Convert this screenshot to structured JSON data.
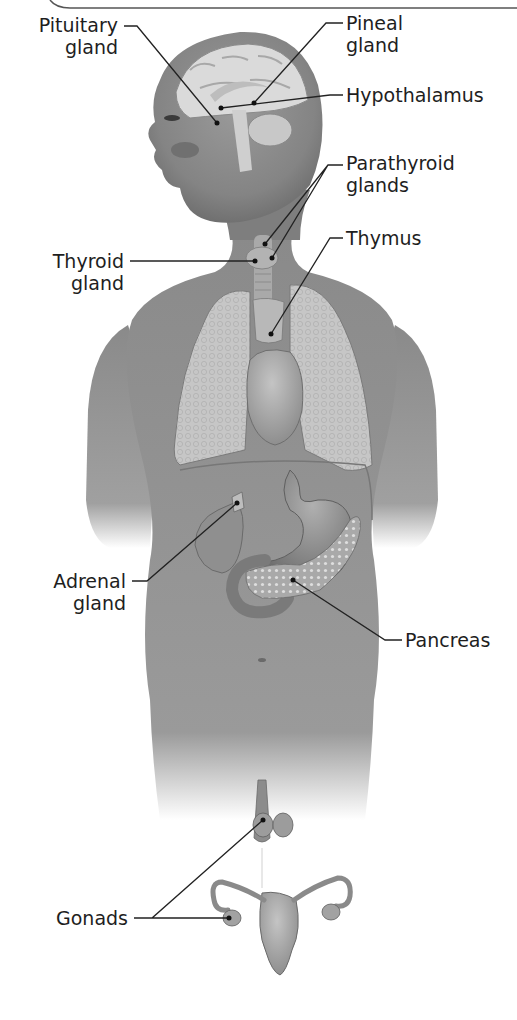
{
  "figure": {
    "colors": {
      "background": "#ffffff",
      "skin": "#8a8a8a",
      "skin_shadow": "#6e6e6e",
      "organ": "#b7b7b7",
      "organ_dark": "#7c7c7c",
      "lung": "#c9c9c9",
      "brain": "#d9d9d9",
      "leader_line": "#222222",
      "text": "#1e1e1e"
    }
  },
  "labels": {
    "pituitary": {
      "line1": "Pituitary",
      "line2": "gland"
    },
    "pineal": {
      "line1": "Pineal",
      "line2": "gland"
    },
    "hypothalamus": {
      "line1": "Hypothalamus"
    },
    "parathyroid": {
      "line1": "Parathyroid",
      "line2": "glands"
    },
    "thymus": {
      "line1": "Thymus"
    },
    "thyroid": {
      "line1": "Thyroid",
      "line2": "gland"
    },
    "adrenal": {
      "line1": "Adrenal",
      "line2": "gland"
    },
    "pancreas": {
      "line1": "Pancreas"
    },
    "gonads": {
      "line1": "Gonads"
    }
  }
}
